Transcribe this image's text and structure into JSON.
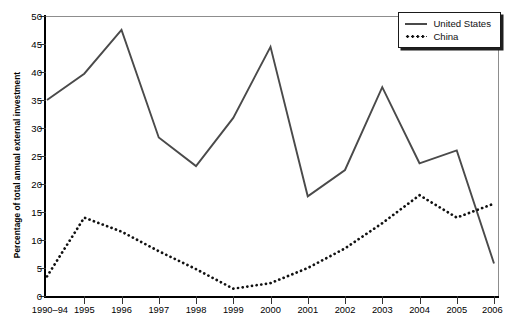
{
  "chart_data": {
    "type": "line",
    "title": "",
    "subtitle": "",
    "xlabel": "",
    "ylabel": "Percentage of total annual external investment",
    "categories": [
      "1990–94",
      "1995",
      "1996",
      "1997",
      "1998",
      "1999",
      "2000",
      "2001",
      "2002",
      "2003",
      "2004",
      "2005",
      "2006"
    ],
    "ylim": [
      0,
      50
    ],
    "yticks": [
      0,
      5,
      10,
      15,
      20,
      25,
      30,
      35,
      40,
      45,
      50
    ],
    "ytick_labels": [
      "0",
      "5",
      "10",
      "15",
      "20",
      "25",
      "30",
      "35",
      "40",
      "45",
      "50"
    ],
    "grid": false,
    "legend_position": "top-right",
    "series": [
      {
        "name": "United States",
        "style": "solid",
        "color": "#4a4a4a",
        "values": [
          35.0,
          39.7,
          47.5,
          28.3,
          23.2,
          31.8,
          44.5,
          17.8,
          22.5,
          37.3,
          23.7,
          26.0,
          5.8
        ]
      },
      {
        "name": "China",
        "style": "dotted",
        "color": "#111111",
        "values": [
          3.5,
          14.0,
          11.5,
          8.0,
          4.8,
          1.3,
          2.3,
          5.0,
          8.5,
          13.0,
          18.0,
          14.0,
          16.5
        ]
      }
    ]
  },
  "legend": {
    "entries": [
      {
        "label": "United States",
        "swatch": "solid-line-swatch"
      },
      {
        "label": "China",
        "swatch": "dotted-line-swatch"
      }
    ]
  },
  "caption": {
    "source": ""
  }
}
